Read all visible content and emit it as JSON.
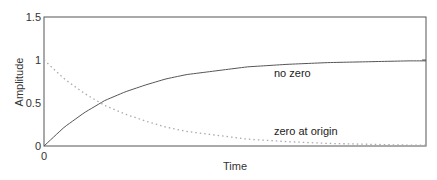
{
  "chart_data": {
    "type": "line",
    "title": "",
    "xlabel": "Time",
    "ylabel": "Amplitude",
    "xlim": [
      0,
      4.7
    ],
    "ylim": [
      0,
      1.5
    ],
    "x_ticks": [
      "0"
    ],
    "y_ticks": [
      "0",
      "0.5",
      "1",
      "1.5"
    ],
    "grid": false,
    "legend": "inline annotations",
    "x": [
      0,
      0.25,
      0.5,
      0.75,
      1.0,
      1.25,
      1.5,
      1.75,
      2.0,
      2.5,
      3.0,
      3.5,
      4.0,
      4.5,
      4.7
    ],
    "series": [
      {
        "name": "no zero",
        "style": "solid",
        "values": [
          0,
          0.22,
          0.39,
          0.53,
          0.63,
          0.71,
          0.78,
          0.83,
          0.86,
          0.92,
          0.95,
          0.97,
          0.98,
          0.99,
          0.99
        ]
      },
      {
        "name": "zero at origin",
        "style": "dotted",
        "values": [
          1,
          0.78,
          0.61,
          0.47,
          0.37,
          0.29,
          0.22,
          0.17,
          0.14,
          0.08,
          0.05,
          0.03,
          0.02,
          0.01,
          0.01
        ]
      }
    ],
    "annotations": [
      {
        "text": "no zero",
        "x": 2.8,
        "y": 0.82
      },
      {
        "text": "zero at origin",
        "x": 2.8,
        "y": 0.15
      }
    ]
  },
  "colors": {
    "axes": "#555555",
    "no_zero_line": "#555555",
    "zero_at_origin_line": "#aaaaaa"
  }
}
